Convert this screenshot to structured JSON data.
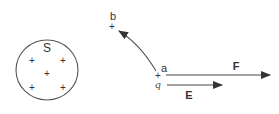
{
  "diagram": {
    "colors": {
      "stroke": "#555555",
      "text": "#333333",
      "arrow": "#333333"
    },
    "sphere": {
      "label": "S",
      "charge_symbols": [
        "+",
        "+",
        "+",
        "+",
        "+"
      ]
    },
    "point_a": {
      "label": "a",
      "charge_symbol": "+",
      "charge_label": "q"
    },
    "point_b": {
      "label": "b",
      "charge_symbol": "+"
    },
    "vectors": {
      "force": {
        "label": "F"
      },
      "field": {
        "label": "E"
      }
    }
  }
}
